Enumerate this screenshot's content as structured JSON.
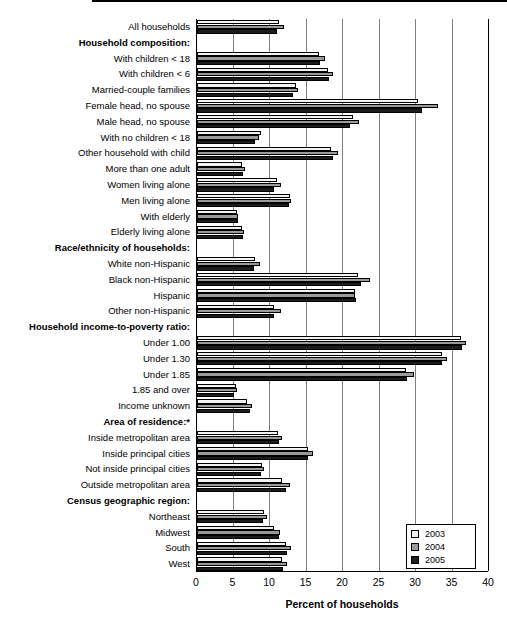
{
  "chart_data": {
    "type": "bar",
    "orientation": "horizontal",
    "title": "",
    "xlabel": "Percent of households",
    "ylabel": "",
    "xlim": [
      0,
      40
    ],
    "xticks": [
      0,
      5,
      10,
      15,
      20,
      25,
      30,
      35,
      40
    ],
    "grid": "vertical",
    "legend_position": "bottom-right",
    "legend": [
      "2003",
      "2004",
      "2005"
    ],
    "series": [
      {
        "name": "2003",
        "color": "#f2f2f2",
        "values": [
          11.2,
          null,
          16.7,
          17.9,
          13.5,
          30.3,
          21.4,
          8.7,
          18.4,
          6.2,
          11.0,
          12.8,
          5.5,
          6.1,
          null,
          8.0,
          22.0,
          21.7,
          10.5,
          null,
          36.2,
          33.6,
          28.6,
          5.3,
          6.8,
          null,
          11.1,
          15.2,
          8.9,
          11.6,
          null,
          9.2,
          10.6,
          12.2,
          11.6
        ]
      },
      {
        "name": "2004",
        "color": "#9a9a9a",
        "values": [
          11.9,
          null,
          17.6,
          18.6,
          13.9,
          33.0,
          22.2,
          8.5,
          19.3,
          6.6,
          11.5,
          12.9,
          5.6,
          6.4,
          null,
          8.6,
          23.7,
          21.7,
          11.5,
          null,
          36.8,
          34.2,
          29.7,
          5.5,
          7.6,
          null,
          11.7,
          15.9,
          9.2,
          12.7,
          null,
          9.6,
          11.4,
          12.9,
          12.3
        ]
      },
      {
        "name": "2005",
        "color": "#1c1c1c",
        "values": [
          11.0,
          null,
          16.9,
          18.1,
          13.1,
          30.8,
          21.0,
          8.0,
          18.6,
          6.3,
          10.6,
          12.6,
          5.6,
          6.3,
          null,
          7.8,
          22.4,
          21.8,
          10.6,
          null,
          36.3,
          33.5,
          28.8,
          5.0,
          7.3,
          null,
          11.3,
          15.2,
          8.8,
          12.2,
          null,
          9.1,
          11.2,
          12.3,
          11.8
        ]
      }
    ],
    "categories": [
      {
        "label": "All households",
        "header": false
      },
      {
        "label": "Household composition:",
        "header": true
      },
      {
        "label": "With children < 18",
        "header": false
      },
      {
        "label": "With children < 6",
        "header": false
      },
      {
        "label": "Married-couple families",
        "header": false
      },
      {
        "label": "Female head, no spouse",
        "header": false
      },
      {
        "label": "Male head, no spouse",
        "header": false
      },
      {
        "label": "With no children < 18",
        "header": false
      },
      {
        "label": "Other household with child",
        "header": false
      },
      {
        "label": "More than one adult",
        "header": false
      },
      {
        "label": "Women living alone",
        "header": false
      },
      {
        "label": "Men living alone",
        "header": false
      },
      {
        "label": "With elderly",
        "header": false
      },
      {
        "label": "Elderly living alone",
        "header": false
      },
      {
        "label": "Race/ethnicity of households:",
        "header": true
      },
      {
        "label": "White non-Hispanic",
        "header": false
      },
      {
        "label": "Black non-Hispanic",
        "header": false
      },
      {
        "label": "Hispanic",
        "header": false
      },
      {
        "label": "Other non-Hispanic",
        "header": false
      },
      {
        "label": "Household income-to-poverty ratio:",
        "header": true
      },
      {
        "label": "Under 1.00",
        "header": false
      },
      {
        "label": "Under 1.30",
        "header": false
      },
      {
        "label": "Under 1.85",
        "header": false
      },
      {
        "label": "1.85 and over",
        "header": false
      },
      {
        "label": "Income unknown",
        "header": false
      },
      {
        "label": "Area of residence:*",
        "header": true
      },
      {
        "label": "Inside metropolitan area",
        "header": false
      },
      {
        "label": "Inside principal cities",
        "header": false
      },
      {
        "label": "Not inside principal cities",
        "header": false
      },
      {
        "label": "Outside metropolitan area",
        "header": false
      },
      {
        "label": "Census geographic region:",
        "header": true
      },
      {
        "label": "Northeast",
        "header": false
      },
      {
        "label": "Midwest",
        "header": false
      },
      {
        "label": "South",
        "header": false
      },
      {
        "label": "West",
        "header": false
      }
    ]
  },
  "axis": {
    "xlabel": "Percent of households",
    "ticks": [
      "0",
      "5",
      "10",
      "15",
      "20",
      "25",
      "30",
      "35",
      "40"
    ]
  },
  "legend": {
    "items": [
      {
        "label": "2003",
        "key": "y2003"
      },
      {
        "label": "2004",
        "key": "y2004"
      },
      {
        "label": "2005",
        "key": "y2005"
      }
    ]
  }
}
